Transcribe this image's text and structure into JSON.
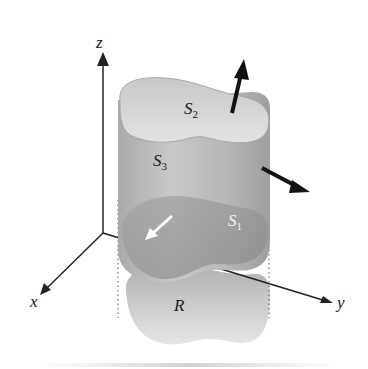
{
  "figure": {
    "axes": {
      "x_label": "x",
      "y_label": "y",
      "z_label": "z"
    },
    "surfaces": {
      "top": {
        "name": "S",
        "sub": "2"
      },
      "side": {
        "name": "S",
        "sub": "3"
      },
      "bottom": {
        "name": "S",
        "sub": "1"
      }
    },
    "region": {
      "label": "R"
    },
    "colors": {
      "axis": "#222222",
      "solid_light": "#d9d9d9",
      "solid_mid": "#b3b3b3",
      "solid_dark": "#8f8f8f",
      "region": "#bdbdbd",
      "normal_arrow": "#111111",
      "inner_arrow": "#ffffff"
    }
  }
}
